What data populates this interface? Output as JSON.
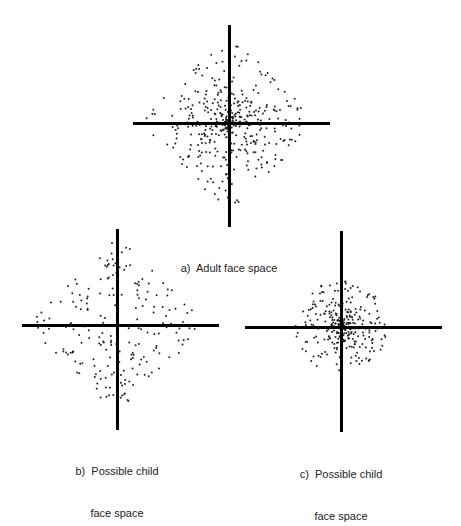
{
  "figure": {
    "panels": [
      {
        "id": "a",
        "caption_lines": [
          "a)  Adult face space"
        ],
        "caption_center": [
          229,
          240
        ],
        "axes": {
          "h": {
            "x1": 133,
            "x2": 330,
            "y": 123,
            "thickness": 3
          },
          "v": {
            "y1": 25,
            "y2": 227,
            "x": 229,
            "thickness": 3
          }
        },
        "cloud": {
          "cx": 229,
          "cy": 123,
          "radius": 86,
          "shape": "diamond",
          "count": 420,
          "density": "concentrated-center",
          "seed": 11
        }
      },
      {
        "id": "b",
        "caption_lines": [
          "b)  Possible child",
          "face space"
        ],
        "caption_center": [
          117,
          450
        ],
        "axes": {
          "h": {
            "x1": 22,
            "x2": 219,
            "y": 325,
            "thickness": 3
          },
          "v": {
            "y1": 229,
            "y2": 430,
            "x": 117,
            "thickness": 3
          }
        },
        "cloud": {
          "cx": 117,
          "cy": 325,
          "radius": 86,
          "shape": "diamond",
          "count": 210,
          "density": "sparse-uniform",
          "seed": 23
        }
      },
      {
        "id": "c",
        "caption_lines": [
          "c)  Possible child",
          "face space"
        ],
        "caption_center": [
          341,
          453
        ],
        "axes": {
          "h": {
            "x1": 245,
            "x2": 442,
            "y": 327,
            "thickness": 3
          },
          "v": {
            "y1": 231,
            "y2": 432,
            "x": 341,
            "thickness": 3
          }
        },
        "cloud": {
          "cx": 341,
          "cy": 327,
          "radius": 46,
          "shape": "round",
          "count": 300,
          "density": "concentrated-center",
          "seed": 37
        }
      }
    ],
    "colors": {
      "axis": "#000000",
      "dot": "#222222",
      "background": "#ffffff",
      "text": "#222222"
    }
  }
}
